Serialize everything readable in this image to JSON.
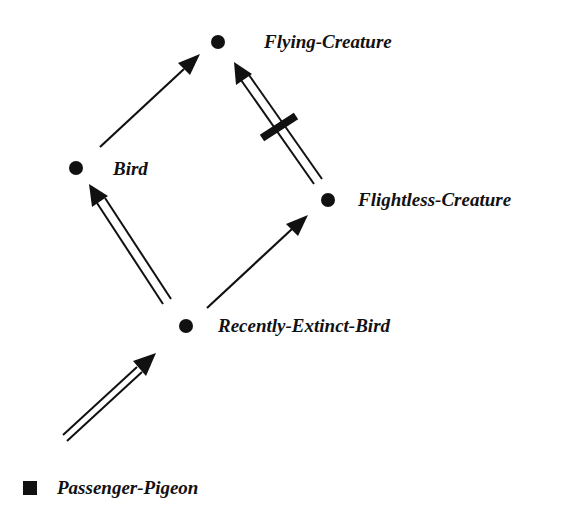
{
  "diagram": {
    "type": "inheritance-network",
    "colors": {
      "ink": "#111111",
      "background": "#ffffff"
    },
    "nodes": [
      {
        "id": "flying-creature",
        "label": "Flying-Creature",
        "shape": "circle",
        "x": 218,
        "y": 42,
        "label_x": 264,
        "label_y": 32
      },
      {
        "id": "bird",
        "label": "Bird",
        "shape": "circle",
        "x": 76,
        "y": 168,
        "label_x": 113,
        "label_y": 159
      },
      {
        "id": "flightless-creature",
        "label": "Flightless-Creature",
        "shape": "circle",
        "x": 328,
        "y": 200,
        "label_x": 358,
        "label_y": 190
      },
      {
        "id": "recently-extinct-bird",
        "label": "Recently-Extinct-Bird",
        "shape": "circle",
        "x": 186,
        "y": 326,
        "label_x": 218,
        "label_y": 316
      },
      {
        "id": "passenger-pigeon",
        "label": "Passenger-Pigeon",
        "shape": "square",
        "x": 30,
        "y": 488,
        "label_x": 57,
        "label_y": 478
      }
    ],
    "edges": [
      {
        "from": "bird",
        "to": "flying-creature",
        "style": "single",
        "negated": false
      },
      {
        "from": "flightless-creature",
        "to": "flying-creature",
        "style": "double",
        "negated": true
      },
      {
        "from": "recently-extinct-bird",
        "to": "bird",
        "style": "double",
        "negated": false
      },
      {
        "from": "recently-extinct-bird",
        "to": "flightless-creature",
        "style": "single",
        "negated": false
      },
      {
        "from": "passenger-pigeon",
        "to": "recently-extinct-bird",
        "style": "double",
        "negated": false
      }
    ]
  }
}
